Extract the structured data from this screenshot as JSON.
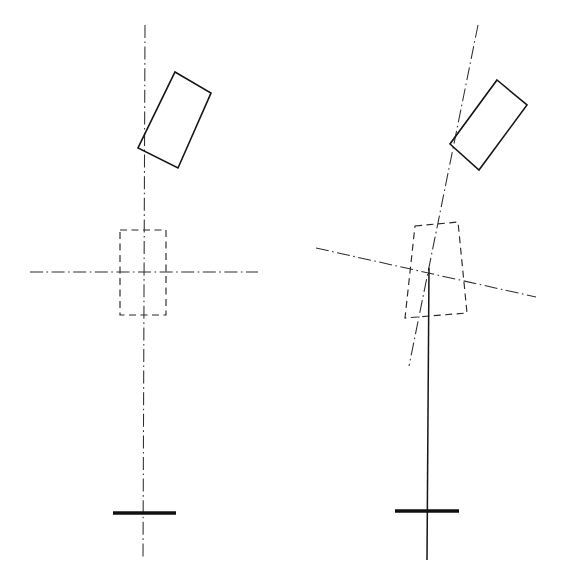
{
  "figure": {
    "background_color": "#ffffff",
    "line_color": "#161616",
    "centerline_color": "#2e2e2e",
    "dashed_color": "#2a2a2a",
    "canvas": {
      "width": 568,
      "height": 575
    }
  },
  "views": [
    {
      "id": "left-view",
      "name": "neutral-position-view",
      "label": "",
      "pivot": {
        "x": 143,
        "y": 272
      },
      "block": {
        "name": "tilted-solid-block",
        "points": "175,72 211,93 178,168 138,148",
        "stroke_color": "#161616"
      },
      "hub": {
        "name": "dashed-hub-rectangle",
        "points": "120,230 166,230 166,315 120,315",
        "stroke_color": "#2a2a2a"
      },
      "vertical_axis": {
        "name": "vertical-centerline",
        "x1": 145,
        "y1": 25,
        "x2": 143,
        "y2": 560,
        "style": "dash-dot"
      },
      "horizontal_axis": {
        "name": "horizontal-centerline",
        "x1": 30,
        "y1": 272,
        "x2": 258,
        "y2": 272,
        "style": "dash-dot"
      },
      "base_bar": {
        "name": "base-crossbar",
        "x1": 113,
        "y1": 513,
        "x2": 176,
        "y2": 513
      },
      "rod": null
    },
    {
      "id": "right-view",
      "name": "rotated-position-view",
      "label": "",
      "pivot": {
        "x": 435,
        "y": 272
      },
      "block": {
        "name": "tilted-solid-block",
        "points": "497,80 527,105 479,170 450,144",
        "stroke_color": "#161616"
      },
      "hub": {
        "name": "dashed-hub-rectangle",
        "points": "415,226 458,222 467,313 405,318",
        "stroke_color": "#2a2a2a"
      },
      "tilted_axis": {
        "name": "tilted-centerline",
        "x1": 478,
        "y1": 25,
        "x2": 409,
        "y2": 366,
        "style": "dash-dot"
      },
      "horizontal_axis": {
        "name": "tilted-horizontal-centerline",
        "x1": 316,
        "y1": 248,
        "x2": 536,
        "y2": 297,
        "style": "dash-dot"
      },
      "base_bar": {
        "name": "base-crossbar",
        "x1": 395,
        "y1": 511,
        "x2": 459,
        "y2": 511
      },
      "rod": {
        "name": "vertical-solid-rod",
        "x1": 429,
        "y1": 268,
        "x2": 427,
        "y2": 560,
        "style": "solid"
      }
    }
  ]
}
